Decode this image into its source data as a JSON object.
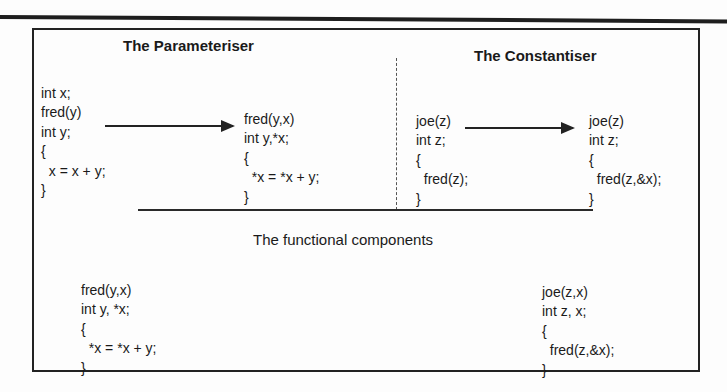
{
  "diagram": {
    "parameteriser": {
      "title": "The Parameteriser",
      "before": [
        "int x;",
        "fred(y)",
        "int y;",
        "{",
        "  x = x + y;",
        "}"
      ],
      "after": [
        "fred(y,x)",
        "int y,*x;",
        "{",
        "  *x = *x + y;",
        "}"
      ]
    },
    "constantiser": {
      "title": "The Constantiser",
      "before": [
        "joe(z)",
        "int z;",
        "{",
        "  fred(z);",
        "}"
      ],
      "after": [
        "joe(z)",
        "int z;",
        "{",
        "  fred(z,&x);",
        "}"
      ]
    },
    "functional": {
      "title": "The functional components",
      "left": [
        "fred(y,x)",
        "int y, *x;",
        "{",
        "  *x = *x + y;",
        "}"
      ],
      "right": [
        "joe(z,x)",
        "int z, x;",
        "{",
        "  fred(z,&x);",
        "}"
      ]
    },
    "arrows": [
      {
        "from": "parameteriser-before",
        "to": "parameteriser-after",
        "icon": "right-arrow-icon"
      },
      {
        "from": "constantiser-before",
        "to": "constantiser-after",
        "icon": "right-arrow-icon"
      }
    ]
  }
}
